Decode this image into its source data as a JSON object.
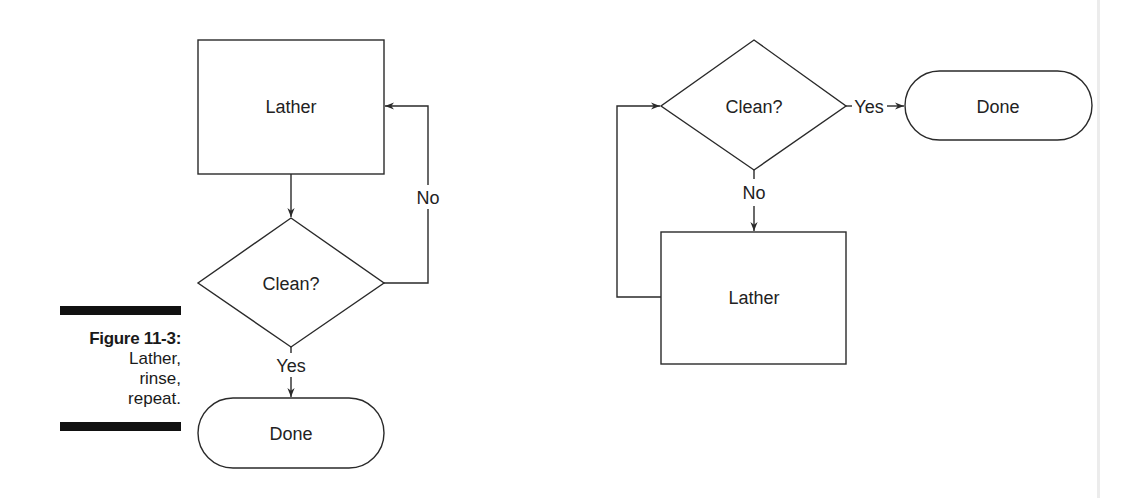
{
  "figure": {
    "number_label": "Figure 11-3:",
    "caption_lines": [
      "Lather,",
      "rinse,",
      "repeat."
    ]
  },
  "left_flowchart": {
    "nodes": {
      "lather": {
        "shape": "rectangle",
        "label": "Lather"
      },
      "clean": {
        "shape": "diamond",
        "label": "Clean?"
      },
      "done": {
        "shape": "terminator",
        "label": "Done"
      }
    },
    "edges": {
      "lather_to_clean": {
        "from": "lather",
        "to": "clean",
        "label": ""
      },
      "clean_no": {
        "from": "clean",
        "to": "lather",
        "label": "No"
      },
      "clean_yes": {
        "from": "clean",
        "to": "done",
        "label": "Yes"
      }
    }
  },
  "right_flowchart": {
    "nodes": {
      "clean": {
        "shape": "diamond",
        "label": "Clean?"
      },
      "done": {
        "shape": "terminator",
        "label": "Done"
      },
      "lather": {
        "shape": "rectangle",
        "label": "Lather"
      }
    },
    "edges": {
      "clean_yes": {
        "from": "clean",
        "to": "done",
        "label": "Yes"
      },
      "clean_no": {
        "from": "clean",
        "to": "lather",
        "label": "No"
      },
      "lather_to_clean": {
        "from": "lather",
        "to": "clean",
        "label": ""
      }
    }
  },
  "colors": {
    "stroke": "#2a2a2a",
    "text": "#222222",
    "background": "#ffffff",
    "caption_bar": "#111111"
  }
}
